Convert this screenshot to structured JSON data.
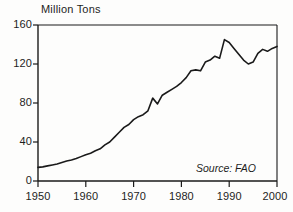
{
  "chart_data": {
    "type": "line",
    "title": "",
    "subtitle": "",
    "xlabel": "",
    "ylabel": "Million Tons",
    "ylabel_position": "above-axis-top-left",
    "xlim": [
      1950,
      2000
    ],
    "ylim": [
      0,
      160
    ],
    "grid": false,
    "legend": null,
    "annotations": [
      {
        "text": "Source: FAO",
        "style": "italic",
        "position": "bottom-right-inside-plot"
      }
    ],
    "xticks": [
      1950,
      1960,
      1970,
      1980,
      1990,
      2000
    ],
    "xtick_labels": [
      "1950",
      "1960",
      "1970",
      "1980",
      "1990",
      "2000"
    ],
    "yticks": [
      0,
      40,
      80,
      120,
      160
    ],
    "ytick_labels": [
      "0",
      "40",
      "80",
      "120",
      "160"
    ],
    "line_color": "#1a1a1a",
    "line_width": 1.6,
    "series": [
      {
        "name": "World Fish Catch",
        "units": "Million Tons",
        "x": [
          1950,
          1951,
          1952,
          1953,
          1954,
          1955,
          1956,
          1957,
          1958,
          1959,
          1960,
          1961,
          1962,
          1963,
          1964,
          1965,
          1966,
          1967,
          1968,
          1969,
          1970,
          1971,
          1972,
          1973,
          1974,
          1975,
          1976,
          1977,
          1978,
          1979,
          1980,
          1981,
          1982,
          1983,
          1984,
          1985,
          1986,
          1987,
          1988,
          1989,
          1990,
          1991,
          1992,
          1993,
          1994,
          1995,
          1996,
          1997,
          1998,
          1999,
          2000
        ],
        "values": [
          14,
          15,
          17,
          18,
          19,
          21,
          22,
          23,
          25,
          27,
          29,
          31,
          34,
          36,
          40,
          44,
          48,
          52,
          56,
          57,
          61,
          63,
          62,
          66,
          71,
          69,
          74,
          75,
          77,
          79,
          80,
          83,
          86,
          87,
          92,
          95,
          101,
          102,
          108,
          110,
          108,
          108,
          110,
          112,
          120,
          122,
          124,
          122,
          118,
          125,
          130
        ]
      }
    ]
  },
  "chart_points_plot": {
    "description": "Traced curve control points as (year, million tons) matching the drawn line",
    "points": [
      [
        1950,
        14
      ],
      [
        1951,
        14.5
      ],
      [
        1952,
        15.5
      ],
      [
        1953,
        16.5
      ],
      [
        1954,
        17.5
      ],
      [
        1955,
        19
      ],
      [
        1956,
        20.5
      ],
      [
        1957,
        21.5
      ],
      [
        1958,
        23
      ],
      [
        1959,
        25
      ],
      [
        1960,
        27
      ],
      [
        1961,
        28.5
      ],
      [
        1962,
        31
      ],
      [
        1963,
        33
      ],
      [
        1964,
        37
      ],
      [
        1965,
        40
      ],
      [
        1966,
        45
      ],
      [
        1967,
        50
      ],
      [
        1968,
        55
      ],
      [
        1969,
        58
      ],
      [
        1970,
        63
      ],
      [
        1971,
        66
      ],
      [
        1972,
        68
      ],
      [
        1973,
        72
      ],
      [
        1974,
        85
      ],
      [
        1975,
        79
      ],
      [
        1976,
        88
      ],
      [
        1977,
        91
      ],
      [
        1978,
        94
      ],
      [
        1979,
        97
      ],
      [
        1980,
        101
      ],
      [
        1981,
        106
      ],
      [
        1982,
        113
      ],
      [
        1983,
        114
      ],
      [
        1984,
        113
      ],
      [
        1985,
        122
      ],
      [
        1986,
        124
      ],
      [
        1987,
        128
      ],
      [
        1988,
        126
      ],
      [
        1989,
        145
      ],
      [
        1990,
        142
      ],
      [
        1991,
        136
      ],
      [
        1992,
        130
      ],
      [
        1993,
        124
      ],
      [
        1994,
        120
      ],
      [
        1995,
        122
      ],
      [
        1996,
        131
      ],
      [
        1997,
        135
      ],
      [
        1998,
        133
      ],
      [
        1999,
        136
      ],
      [
        2000,
        138
      ]
    ]
  },
  "axes": {
    "ylabel": "Million Tons",
    "ytick_labels": [
      "160",
      "120",
      "80",
      "40",
      "0"
    ],
    "xtick_labels": [
      "1950",
      "1960",
      "1970",
      "1980",
      "1990",
      "2000"
    ]
  },
  "source": {
    "text": "Source: FAO"
  }
}
